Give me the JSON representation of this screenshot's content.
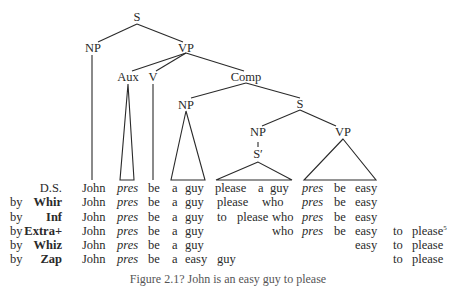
{
  "tree": {
    "nodes": {
      "s_root": "S",
      "np_subject": "NP",
      "vp_main": "VP",
      "aux": "Aux",
      "v": "V",
      "comp": "Comp",
      "np_comp": "NP",
      "s_embedded": "S",
      "np_embedded": "NP",
      "s_prime": "S′",
      "vp_embedded": "VP"
    }
  },
  "derivation": {
    "rows": [
      {
        "prefix": "",
        "rule": "D.S.",
        "rule_bold": false,
        "cells": [
          {
            "text": "John",
            "x": 82
          },
          {
            "text": "pres",
            "x": 117,
            "italic": true
          },
          {
            "text": "be",
            "x": 148
          },
          {
            "text": "a",
            "x": 172
          },
          {
            "text": "guy",
            "x": 185
          },
          {
            "text": "please",
            "x": 215
          },
          {
            "text": "a",
            "x": 258
          },
          {
            "text": "guy",
            "x": 270
          },
          {
            "text": "pres",
            "x": 302,
            "italic": true
          },
          {
            "text": "be",
            "x": 334
          },
          {
            "text": "easy",
            "x": 355
          }
        ]
      },
      {
        "prefix": "by",
        "rule": "Whir",
        "rule_bold": true,
        "cells": [
          {
            "text": "John",
            "x": 82
          },
          {
            "text": "pres",
            "x": 117,
            "italic": true
          },
          {
            "text": "be",
            "x": 148
          },
          {
            "text": "a",
            "x": 172
          },
          {
            "text": "guy",
            "x": 185
          },
          {
            "text": "please",
            "x": 217
          },
          {
            "text": "who",
            "x": 262
          },
          {
            "text": "pres",
            "x": 302,
            "italic": true
          },
          {
            "text": "be",
            "x": 334
          },
          {
            "text": "easy",
            "x": 355
          }
        ]
      },
      {
        "prefix": "by",
        "rule": "Inf",
        "rule_bold": true,
        "cells": [
          {
            "text": "John",
            "x": 82
          },
          {
            "text": "pres",
            "x": 117,
            "italic": true
          },
          {
            "text": "be",
            "x": 148
          },
          {
            "text": "a",
            "x": 172
          },
          {
            "text": "guy",
            "x": 185
          },
          {
            "text": "to",
            "x": 217
          },
          {
            "text": "please",
            "x": 237
          },
          {
            "text": "who",
            "x": 272
          },
          {
            "text": "pres",
            "x": 302,
            "italic": true
          },
          {
            "text": "be",
            "x": 334
          },
          {
            "text": "easy",
            "x": 355
          }
        ]
      },
      {
        "prefix": "by",
        "rule": "Extra+",
        "rule_bold": true,
        "cells": [
          {
            "text": "John",
            "x": 82
          },
          {
            "text": "pres",
            "x": 117,
            "italic": true
          },
          {
            "text": "be",
            "x": 148
          },
          {
            "text": "a",
            "x": 172
          },
          {
            "text": "guy",
            "x": 185
          },
          {
            "text": "who",
            "x": 272
          },
          {
            "text": "pres",
            "x": 302,
            "italic": true
          },
          {
            "text": "be",
            "x": 334
          },
          {
            "text": "easy",
            "x": 355
          },
          {
            "text": "to",
            "x": 393
          },
          {
            "text": "please",
            "x": 412,
            "sup": "5"
          }
        ]
      },
      {
        "prefix": "by",
        "rule": "Whiz",
        "rule_bold": true,
        "cells": [
          {
            "text": "John",
            "x": 82
          },
          {
            "text": "pres",
            "x": 117,
            "italic": true
          },
          {
            "text": "be",
            "x": 148
          },
          {
            "text": "a",
            "x": 172
          },
          {
            "text": "guy",
            "x": 185
          },
          {
            "text": "easy",
            "x": 355
          },
          {
            "text": "to",
            "x": 393
          },
          {
            "text": "please",
            "x": 412
          }
        ]
      },
      {
        "prefix": "by",
        "rule": "Zap",
        "rule_bold": true,
        "cells": [
          {
            "text": "John",
            "x": 82
          },
          {
            "text": "pres",
            "x": 117,
            "italic": true
          },
          {
            "text": "be",
            "x": 148
          },
          {
            "text": "a",
            "x": 172
          },
          {
            "text": "easy",
            "x": 185
          },
          {
            "text": "guy",
            "x": 217
          },
          {
            "text": "to",
            "x": 393
          },
          {
            "text": "please",
            "x": 412
          }
        ]
      }
    ]
  },
  "caption": "Figure 2.1?  John is an easy guy to please"
}
